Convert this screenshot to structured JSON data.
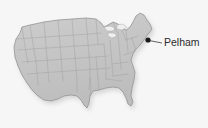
{
  "figure": {
    "type": "locator-map",
    "background_color": "#f6f6f6",
    "land_fill": "#c6c6c6",
    "land_outline_color": "#8a8a8a",
    "state_border_color": "#9e9e9e",
    "shadow_color": "#b0b0b0",
    "water_color": "#efefef"
  },
  "annotations": [
    {
      "name": "pelham",
      "label": "Pelham",
      "marker": "filled-dot",
      "marker_color": "#1a1a1a",
      "marker_x": 148,
      "marker_y": 40,
      "leader_line_color": "#3a3a3a",
      "label_x": 164,
      "label_y": 43
    }
  ],
  "map_geometry": {
    "outline_path": "M20,33 L22,27 L30,25 L44,22 L58,20 L72,19 L86,18 L96,19 L101,23 L104,27 L108,25 L113,22 L118,24 L121,28 L126,30 L130,27 L133,22 L136,16 L140,13 L144,15 L147,20 L150,24 L152,29 L149,33 L146,37 L143,41 L140,45 L136,49 L133,54 L131,60 L133,66 L135,72 L134,80 L132,88 L131,96 L133,102 L131,106 L128,104 L126,98 L123,92 L119,88 L113,87 L106,88 L99,90 L93,91 L90,96 L89,103 L87,108 L84,105 L81,100 L77,96 L71,95 L64,96 L58,99 L51,101 L44,100 L38,96 L32,90 L27,83 L22,75 L18,66 L15,57 L14,47 L16,39 Z",
    "state_lines": [
      "M22,27 L24,40 L26,52 L28,63",
      "M30,25 L32,38 L34,50 L36,61",
      "M44,22 L45,34 L46,46 L47,58",
      "M58,20 L59,33 L60,45 L61,57",
      "M72,19 L73,32 L74,44 L75,56",
      "M86,18 L87,31 L88,43 L89,55",
      "M96,19 L97,32 L98,44",
      "M16,39 L30,38 L45,37 L60,36 L75,35 L90,34 L101,33",
      "M18,50 L32,49 L47,48 L62,47 L77,46 L92,45 L104,44",
      "M22,62 L36,61 L51,60 L66,59 L81,58 L95,57 L108,56",
      "M27,74 L40,73 L54,72 L68,71 L82,70 L96,69 L110,68",
      "M89,55 L90,66 L90,78 L89,90",
      "M96,57 L97,68 L98,79",
      "M104,44 L105,56 L106,68 L106,79",
      "M110,40 L111,52 L112,64 L113,76",
      "M118,33 L119,45 L120,57 L121,69",
      "M126,30 L127,41 L128,52",
      "M101,23 L108,25 L113,22",
      "M113,22 L116,30 L118,33",
      "M121,28 L124,35 L126,40",
      "M126,40 L132,38 L138,36",
      "M132,38 L134,45 L136,50",
      "M136,50 L130,53 L124,55",
      "M112,64 L120,63 L128,62",
      "M113,76 L121,75 L128,74",
      "M106,79 L114,80 L122,81",
      "M98,79 L99,88 L99,95",
      "M90,78 L91,88 L90,96",
      "M75,56 L76,68 L77,80 L77,92",
      "M61,57 L62,69 L63,81",
      "M47,58 L48,70 L49,82",
      "M36,61 L37,73 L38,85"
    ],
    "great_lakes": [
      "M104,27 L110,26 L115,28 L113,31 L107,31 Z",
      "M117,25 L123,24 L127,27 L122,30 L117,29 Z",
      "M108,33 L114,33 L117,36 L112,38 L108,36 Z"
    ]
  }
}
